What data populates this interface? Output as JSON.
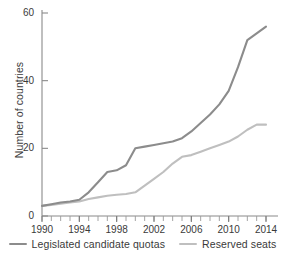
{
  "chart_data": {
    "type": "line",
    "title": "",
    "subtitle": "",
    "xlabel": "",
    "ylabel": "Number of countries",
    "xlim": [
      1990,
      2014
    ],
    "ylim": [
      0,
      60
    ],
    "grid": false,
    "legend_position": "bottom",
    "xticks": [
      "1990",
      "1994",
      "1998",
      "2002",
      "2006",
      "2010",
      "2014"
    ],
    "xtick_values": [
      1990,
      1994,
      1998,
      2002,
      2006,
      2010,
      2014
    ],
    "xminor_step": 1,
    "yticks": [
      "0",
      "20",
      "40",
      "60"
    ],
    "ytick_values": [
      0,
      20,
      40,
      60
    ],
    "x": [
      1990,
      1991,
      1992,
      1993,
      1994,
      1995,
      1996,
      1997,
      1998,
      1999,
      2000,
      2001,
      2002,
      2003,
      2004,
      2005,
      2006,
      2007,
      2008,
      2009,
      2010,
      2011,
      2012,
      2013,
      2014
    ],
    "series": [
      {
        "name": "Legislated candidate quotas",
        "color": "#8c8c8c",
        "values": [
          3,
          3.5,
          4,
          4.3,
          4.8,
          7,
          10,
          13,
          13.5,
          15,
          20,
          20.5,
          21,
          21.5,
          22,
          23,
          25,
          27.5,
          30,
          33,
          37,
          44,
          52,
          54,
          56
        ]
      },
      {
        "name": "Reserved seats",
        "color": "#bfbfbf",
        "values": [
          3,
          3.3,
          3.6,
          4,
          4.3,
          5,
          5.5,
          6,
          6.3,
          6.5,
          7,
          9,
          11,
          13,
          15.5,
          17.5,
          18,
          19,
          20,
          21,
          22,
          23.5,
          25.5,
          27,
          27
        ]
      }
    ]
  },
  "axis": {
    "ylabel": "Number of countries",
    "ytick_labels": [
      "60",
      "40",
      "20",
      "0"
    ],
    "xtick_labels": [
      "1990",
      "1994",
      "1998",
      "2002",
      "2006",
      "2010",
      "2014"
    ]
  },
  "legend": {
    "items": [
      {
        "label": "Legislated candidate quotas",
        "color": "#8c8c8c"
      },
      {
        "label": "Reserved seats",
        "color": "#bfbfbf"
      }
    ]
  },
  "colors": {
    "legislated_quotas": "#8c8c8c",
    "reserved_seats": "#bfbfbf",
    "axis": "#7a7a7a",
    "text": "#3a3a3a",
    "background": "#ffffff"
  }
}
